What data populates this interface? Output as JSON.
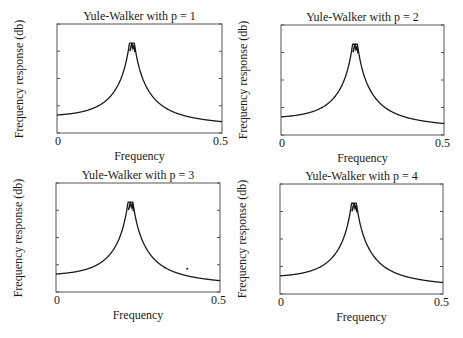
{
  "chart_data": [
    {
      "type": "line",
      "title": "Yule-Walker with p = 1",
      "xlabel": "Frequency",
      "ylabel": "Frequency response (db)",
      "xlim": [
        0,
        0.5
      ],
      "ylim": [
        -10,
        30
      ],
      "xticks": [
        "0",
        "0.5"
      ],
      "yticks": [
        "30",
        "20",
        "10",
        "0",
        "-10"
      ],
      "grid": false,
      "series": [
        {
          "name": "response",
          "peak_x": 0.227,
          "peak_y": 23,
          "x": [
            0,
            0.05,
            0.1,
            0.15,
            0.18,
            0.2,
            0.21,
            0.22,
            0.227,
            0.235,
            0.25,
            0.27,
            0.3,
            0.35,
            0.4,
            0.45,
            0.5
          ],
          "values": [
            -5,
            -4.3,
            -2.5,
            1.5,
            6,
            11,
            15,
            20,
            23,
            19,
            12,
            7,
            3,
            -1.5,
            -4.5,
            -6.3,
            -7
          ]
        }
      ]
    },
    {
      "type": "line",
      "title": "Yule-Walker with p = 2",
      "xlabel": "Frequency",
      "ylabel": "Frequency response (db)",
      "xlim": [
        0,
        0.5
      ],
      "ylim": [
        -10,
        30
      ],
      "xticks": [
        "0",
        "0.5"
      ],
      "yticks": [
        "30",
        "20",
        "10",
        "0",
        "-10"
      ],
      "grid": false,
      "series": [
        {
          "name": "response",
          "peak_x": 0.227,
          "peak_y": 23,
          "x": [
            0,
            0.05,
            0.1,
            0.15,
            0.18,
            0.2,
            0.21,
            0.22,
            0.227,
            0.235,
            0.25,
            0.27,
            0.3,
            0.35,
            0.4,
            0.45,
            0.5
          ],
          "values": [
            -5,
            -4.3,
            -2.5,
            1.5,
            6,
            11,
            15,
            20,
            23,
            19,
            12,
            7,
            3,
            -1.5,
            -4.5,
            -6.3,
            -7
          ]
        }
      ]
    },
    {
      "type": "line",
      "title": "Yule-Walker with p = 3",
      "xlabel": "Frequency",
      "ylabel": "Frequency response (db)",
      "xlim": [
        0,
        0.5
      ],
      "ylim": [
        -10,
        30
      ],
      "xticks": [
        "0",
        "0.5"
      ],
      "yticks": [
        "30",
        "20",
        "10",
        "0",
        "-10"
      ],
      "grid": false,
      "series": [
        {
          "name": "response",
          "peak_x": 0.227,
          "peak_y": 23,
          "x": [
            0,
            0.05,
            0.1,
            0.15,
            0.18,
            0.2,
            0.21,
            0.22,
            0.227,
            0.235,
            0.25,
            0.27,
            0.3,
            0.35,
            0.4,
            0.45,
            0.5
          ],
          "values": [
            -5,
            -4.3,
            -2.5,
            1.5,
            6,
            11,
            15,
            20,
            23,
            19,
            12,
            7,
            3,
            -1.5,
            -4.5,
            -6.3,
            -7
          ]
        }
      ],
      "annotations": [
        {
          "type": "dot",
          "x": 0.4,
          "y": -1.5
        }
      ]
    },
    {
      "type": "line",
      "title": "Yule-Walker with p = 4",
      "xlabel": "Frequency",
      "ylabel": "Frequency response (db)",
      "xlim": [
        0,
        0.5
      ],
      "ylim": [
        -10,
        30
      ],
      "xticks": [
        "0",
        "0.5"
      ],
      "yticks": [
        "30",
        "20",
        "10",
        "0",
        "-10"
      ],
      "grid": false,
      "series": [
        {
          "name": "response",
          "peak_x": 0.227,
          "peak_y": 23,
          "x": [
            0,
            0.05,
            0.1,
            0.15,
            0.18,
            0.2,
            0.21,
            0.22,
            0.227,
            0.235,
            0.25,
            0.27,
            0.3,
            0.35,
            0.4,
            0.45,
            0.5
          ],
          "values": [
            -5,
            -4.3,
            -2.5,
            1.5,
            6,
            11,
            15,
            20,
            23,
            19,
            12,
            7,
            3,
            -1.5,
            -4.5,
            -6.3,
            -7
          ]
        }
      ]
    }
  ],
  "layout": {
    "panels": [
      {
        "box": [
          57,
          24,
          222,
          133
        ]
      },
      {
        "box": [
          281,
          25,
          444,
          135
        ]
      },
      {
        "box": [
          56,
          183,
          220,
          292
        ]
      },
      {
        "box": [
          280,
          184,
          443,
          294
        ]
      }
    ],
    "axis_color": "#555555",
    "line_color": "#1a1a1a"
  }
}
